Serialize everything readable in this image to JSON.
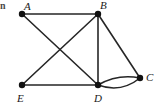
{
  "figure": {
    "kind": "graph-diagram",
    "width": 161,
    "height": 110,
    "background_color": "#ffffff",
    "edge_color": "#262626",
    "vertex_color": "#111111",
    "label_color": "#1a1a1a",
    "margin_text_fragment": "n"
  },
  "graph": {
    "vertices": [
      {
        "id": "A",
        "label": "A",
        "x": 22,
        "y": 14,
        "label_x": 24,
        "label_y": 1
      },
      {
        "id": "B",
        "label": "B",
        "x": 98,
        "y": 14,
        "label_x": 100,
        "label_y": 0
      },
      {
        "id": "C",
        "label": "C",
        "x": 140,
        "y": 78,
        "label_x": 146,
        "label_y": 72
      },
      {
        "id": "D",
        "label": "D",
        "x": 98,
        "y": 85,
        "label_x": 94,
        "label_y": 93
      },
      {
        "id": "E",
        "label": "E",
        "x": 22,
        "y": 85,
        "label_x": 17,
        "label_y": 93
      }
    ],
    "edges": [
      {
        "from": "A",
        "to": "B",
        "shape": "straight"
      },
      {
        "from": "A",
        "to": "D",
        "shape": "straight"
      },
      {
        "from": "B",
        "to": "E",
        "shape": "straight"
      },
      {
        "from": "B",
        "to": "D",
        "shape": "straight"
      },
      {
        "from": "B",
        "to": "C",
        "shape": "straight"
      },
      {
        "from": "E",
        "to": "D",
        "shape": "straight"
      },
      {
        "from": "D",
        "to": "C",
        "shape": "curved-upper",
        "bow": 6
      },
      {
        "from": "D",
        "to": "C",
        "shape": "curved-lower",
        "bow": -4
      }
    ],
    "vertex_radius": 3.2,
    "edge_width": 1.6
  }
}
